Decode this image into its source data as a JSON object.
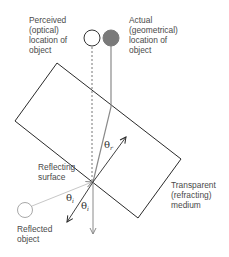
{
  "diagram": {
    "labels": {
      "perceived": [
        "Perceived",
        "(optical)",
        "location of",
        "object"
      ],
      "actual": [
        "Actual",
        "(geometrical)",
        "location of",
        "object"
      ],
      "reflecting_surface": [
        "Reflecting",
        "surface"
      ],
      "transparent_medium": [
        "Transparent",
        "(refracting)",
        "medium"
      ],
      "reflected_object": [
        "Reflected",
        "object"
      ]
    },
    "angles": {
      "refraction": {
        "symbol": "θ",
        "subscript": "r"
      },
      "incidence_left": {
        "symbol": "θ",
        "subscript": "i"
      },
      "incidence_right": {
        "symbol": "θ",
        "subscript": "i"
      }
    },
    "colors": {
      "outline": "#2a2a2a",
      "ray_gray": "#8a8a8a",
      "light_ray": "#b8b8b8",
      "filled_object": "#7a7a7a",
      "open_object_stroke": "#333333",
      "reflected_object_stroke": "#a8a8a8"
    }
  }
}
